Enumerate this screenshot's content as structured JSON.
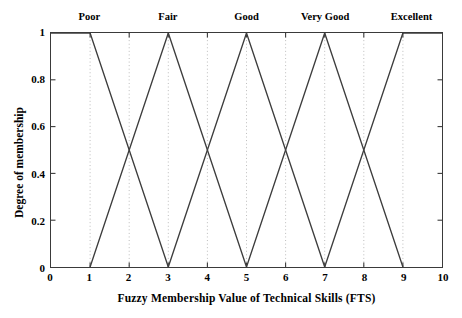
{
  "chart_data": {
    "type": "line",
    "title": "",
    "xlabel": "Fuzzy Membership Value of Technical Skills (FTS)",
    "ylabel": "Degree of membership",
    "xlim": [
      0,
      10
    ],
    "ylim": [
      0,
      1
    ],
    "grid": "vertical-dotted",
    "legend_position": "above-plot-inline",
    "xticks": [
      "0",
      "1",
      "2",
      "3",
      "4",
      "5",
      "6",
      "7",
      "8",
      "9",
      "10"
    ],
    "xtick_values": [
      0,
      1,
      2,
      3,
      4,
      5,
      6,
      7,
      8,
      9,
      10
    ],
    "yticks": [
      "0",
      "0.2",
      "0.4",
      "0.6",
      "0.8",
      "1"
    ],
    "ytick_values": [
      0,
      0.2,
      0.4,
      0.6,
      0.8,
      1
    ],
    "series": [
      {
        "name": "Poor",
        "shape": "trapezoid",
        "params": [
          0,
          0,
          1,
          3
        ],
        "label_x": 1.0,
        "color": "#3d3d3d",
        "x": [
          0,
          1,
          3
        ],
        "values": [
          1,
          1,
          0
        ]
      },
      {
        "name": "Fair",
        "shape": "triangle",
        "params": [
          1,
          3,
          5
        ],
        "label_x": 3.0,
        "color": "#3d3d3d",
        "x": [
          1,
          3,
          5
        ],
        "values": [
          0,
          1,
          0
        ]
      },
      {
        "name": "Good",
        "shape": "triangle",
        "params": [
          3,
          5,
          7
        ],
        "label_x": 5.0,
        "color": "#3d3d3d",
        "x": [
          3,
          5,
          7
        ],
        "values": [
          0,
          1,
          0
        ]
      },
      {
        "name": "Very Good",
        "shape": "triangle",
        "params": [
          5,
          7,
          9
        ],
        "label_x": 7.0,
        "color": "#3d3d3d",
        "x": [
          5,
          7,
          9
        ],
        "values": [
          0,
          1,
          0
        ]
      },
      {
        "name": "Excellent",
        "shape": "trapezoid",
        "params": [
          7,
          9,
          10,
          10
        ],
        "label_x": 9.2,
        "color": "#3d3d3d",
        "x": [
          7,
          9,
          10
        ],
        "values": [
          0,
          1,
          1
        ]
      }
    ],
    "crossover_points": [
      {
        "x": 2,
        "y": 0.5
      },
      {
        "x": 4,
        "y": 0.5
      },
      {
        "x": 6,
        "y": 0.5
      },
      {
        "x": 8,
        "y": 0.5
      }
    ],
    "annotations": [
      "Poor",
      "Fair",
      "Good",
      "Very Good",
      "Excellent"
    ]
  },
  "style": {
    "line_color": "#3d3d3d",
    "axis_color": "#3a3a3a",
    "grid_color": "#b4b4b4",
    "background": "#ffffff",
    "text_color": "#000000"
  }
}
